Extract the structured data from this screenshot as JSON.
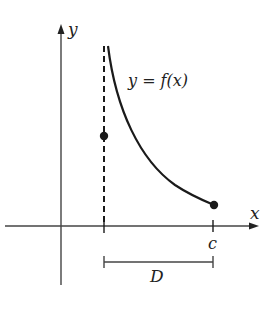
{
  "diagram": {
    "type": "function-graph",
    "axes": {
      "x_label": "x",
      "y_label": "y"
    },
    "curve": {
      "label": "y = f(x)",
      "description": "decreasing curve with vertical asymptote at left end of domain, ending at closed point above c"
    },
    "markers": {
      "c_label": "c",
      "domain_label": "D"
    },
    "points": [
      {
        "name": "isolated-point",
        "style": "filled",
        "on": "dashed asymptote line"
      },
      {
        "name": "endpoint-at-c",
        "style": "filled",
        "on": "curve end"
      }
    ],
    "colors": {
      "ink": "#1a1a1a",
      "axis": "#444444",
      "background": "#ffffff"
    }
  }
}
